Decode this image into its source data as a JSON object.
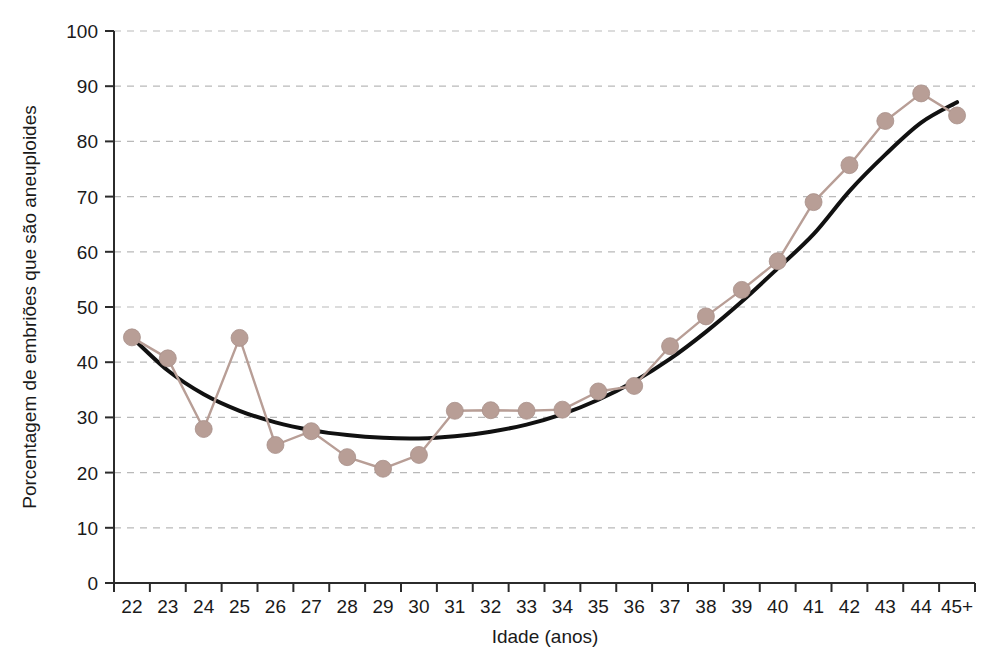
{
  "chart_data": {
    "type": "line",
    "title": "",
    "subtitle": "",
    "xlabel": "Idade (anos)",
    "ylabel": "Porcentagem de embriões que são aneuploides",
    "categories": [
      "22",
      "23",
      "24",
      "25",
      "26",
      "27",
      "28",
      "29",
      "30",
      "31",
      "32",
      "33",
      "34",
      "35",
      "36",
      "37",
      "38",
      "39",
      "40",
      "41",
      "42",
      "43",
      "44",
      "45+"
    ],
    "xlim": [
      0,
      23
    ],
    "ylim": [
      0,
      100
    ],
    "yticks": [
      0,
      10,
      20,
      30,
      40,
      50,
      60,
      70,
      80,
      90,
      100
    ],
    "grid": "horizontal-dashed",
    "legend": "none",
    "series": [
      {
        "name": "Porcentagem observada de embriões aneuploides",
        "style": "line-with-markers",
        "color": "#b89e96",
        "values": [
          44.5,
          40.7,
          27.9,
          44.4,
          25.0,
          27.5,
          22.8,
          20.7,
          23.2,
          31.2,
          31.3,
          31.2,
          31.4,
          34.7,
          35.7,
          42.9,
          48.3,
          53.1,
          58.3,
          69.0,
          75.7,
          83.7,
          88.7,
          84.7
        ]
      },
      {
        "name": "Curva de tendência ajustada",
        "style": "smooth-fit-line",
        "color": "#111111",
        "values": [
          44.5,
          38.5,
          34.2,
          31.2,
          29.1,
          27.7,
          26.8,
          26.3,
          26.2,
          26.6,
          27.4,
          28.7,
          30.6,
          33.2,
          36.5,
          40.6,
          45.5,
          51.0,
          57.0,
          63.2,
          71.0,
          77.6,
          83.4,
          87.1
        ]
      }
    ]
  },
  "axes": {
    "y_tick_labels": [
      "100",
      "90",
      "80",
      "70",
      "60",
      "50",
      "40",
      "30",
      "20",
      "10",
      "0"
    ],
    "x_tick_labels": [
      "22",
      "23",
      "24",
      "25",
      "26",
      "27",
      "28",
      "29",
      "30",
      "31",
      "32",
      "33",
      "34",
      "35",
      "36",
      "37",
      "38",
      "39",
      "40",
      "41",
      "42",
      "43",
      "44",
      "45+"
    ],
    "y_axis_title": "Porcentagem de embriões que são aneuploides",
    "x_axis_title": "Idade (anos)"
  },
  "colors": {
    "marker": "#b89e96",
    "data_line": "#b89e96",
    "fit_line": "#111111",
    "grid": "#b9b9b9",
    "axis": "#2b2b2b",
    "background": "#ffffff"
  }
}
